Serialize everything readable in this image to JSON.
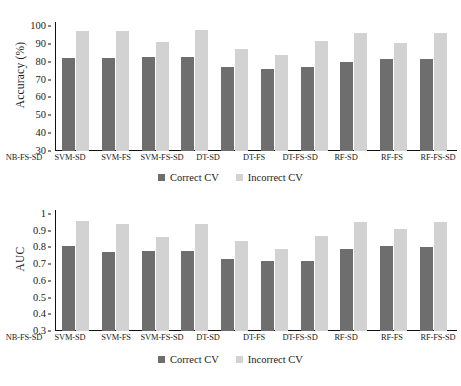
{
  "figure": {
    "background": "#ffffff",
    "series_colors": {
      "correct_cv": "#6e6e6e",
      "incorrect_cv": "#d2d2d2"
    }
  },
  "charts": [
    {
      "id": "chart-accuracy",
      "ylabel": "Accuracy (%)",
      "yticks": [
        "30",
        "40",
        "50",
        "60",
        "70",
        "80",
        "90",
        "100"
      ],
      "legend": [
        {
          "label": "Correct CV",
          "color": "#6e6e6e"
        },
        {
          "label": "Incorrect CV",
          "color": "#d2d2d2"
        }
      ]
    },
    {
      "id": "chart-auc",
      "ylabel": "AUC",
      "yticks": [
        "0.3",
        "0.4",
        "0.5",
        "0.6",
        "0.7",
        "0.8",
        "0.9",
        "1"
      ],
      "legend": [
        {
          "label": "Correct CV",
          "color": "#6e6e6e"
        },
        {
          "label": "Incorrect CV",
          "color": "#d2d2d2"
        }
      ]
    }
  ],
  "chart_data": [
    {
      "type": "bar",
      "title": "",
      "xlabel": "",
      "ylabel": "Accuracy (%)",
      "ylim": [
        30,
        100
      ],
      "ytick_values": [
        30,
        40,
        50,
        60,
        70,
        80,
        90,
        100
      ],
      "grid": false,
      "legend_position": "bottom-center",
      "categories": [
        "NB-FS-SD",
        "SVM-SD",
        "SVM-FS",
        "SVM-FS-SD",
        "DT-SD",
        "DT-FS",
        "DT-FS-SD",
        "RF-SD",
        "RF-FS",
        "RF-FS-SD"
      ],
      "series": [
        {
          "name": "Correct CV",
          "color": "#6e6e6e",
          "values": [
            82,
            82.3,
            82.4,
            82.4,
            77.3,
            75.7,
            77.2,
            80,
            81.3,
            81.4
          ]
        },
        {
          "name": "Incorrect CV",
          "color": "#d2d2d2",
          "values": [
            97,
            97.4,
            90.8,
            97.5,
            87.4,
            83.8,
            91.5,
            96,
            90.3,
            96.1
          ]
        }
      ]
    },
    {
      "type": "bar",
      "title": "",
      "xlabel": "",
      "ylabel": "AUC",
      "ylim": [
        0.3,
        1
      ],
      "ytick_values": [
        0.3,
        0.4,
        0.5,
        0.6,
        0.7,
        0.8,
        0.9,
        1
      ],
      "grid": false,
      "legend_position": "bottom-center",
      "categories": [
        "NB-FS-SD",
        "SVM-SD",
        "SVM-FS",
        "SVM-FS-SD",
        "DT-SD",
        "DT-FS",
        "DT-FS-SD",
        "RF-SD",
        "RF-FS",
        "RF-FS-SD"
      ],
      "series": [
        {
          "name": "Correct CV",
          "color": "#6e6e6e",
          "values": [
            0.81,
            0.77,
            0.78,
            0.78,
            0.73,
            0.72,
            0.72,
            0.79,
            0.81,
            0.8
          ]
        },
        {
          "name": "Incorrect CV",
          "color": "#d2d2d2",
          "values": [
            0.96,
            0.94,
            0.86,
            0.94,
            0.84,
            0.79,
            0.87,
            0.95,
            0.91,
            0.95
          ]
        }
      ]
    }
  ]
}
